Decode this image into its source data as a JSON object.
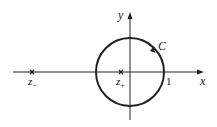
{
  "diagram": {
    "axes": {
      "x_label": "x",
      "y_label": "y"
    },
    "contour": {
      "label": "C",
      "shape": "circle",
      "center": [
        0,
        0
      ],
      "radius": 1,
      "orientation": "counterclockwise"
    },
    "tick": {
      "label": "1"
    },
    "poles": [
      {
        "label": "z",
        "subscript": "−"
      },
      {
        "label": "z",
        "subscript": "+"
      }
    ],
    "colors": {
      "stroke": "#222222"
    }
  }
}
